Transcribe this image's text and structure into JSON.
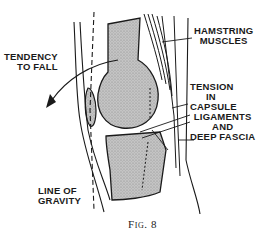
{
  "figure": {
    "caption": "Fig. 8",
    "fill_color": "#b8b8b8",
    "line_color": "#1a1a1a"
  },
  "labels": {
    "tendency_to_fall": [
      "TENDENCY",
      "TO FALL"
    ],
    "hamstring_muscles": [
      "HAMSTRING",
      "MUSCLES"
    ],
    "tension_in_capsule": [
      "TENSION",
      "IN",
      "CAPSULE"
    ],
    "ligaments_deep_fascia": [
      "LIGAMENTS",
      "AND",
      "DEEP FASCIA"
    ],
    "line_of_gravity": [
      "LINE OF",
      "GRAVITY"
    ]
  }
}
